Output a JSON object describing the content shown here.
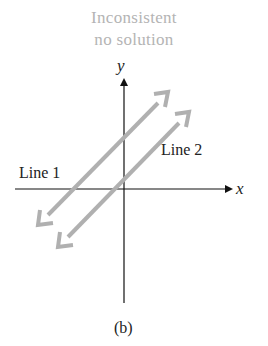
{
  "title": {
    "line1": "Inconsistent",
    "line2": "no solution"
  },
  "axes": {
    "x_label": "x",
    "y_label": "y"
  },
  "lines": [
    {
      "label": "Line 1",
      "color": "#b0b0b0"
    },
    {
      "label": "Line 2",
      "color": "#b0b0b0"
    }
  ],
  "caption": "(b)",
  "colors": {
    "title": "#b4b4b4",
    "axis": "#111111",
    "lines": "#b0b0b0"
  }
}
